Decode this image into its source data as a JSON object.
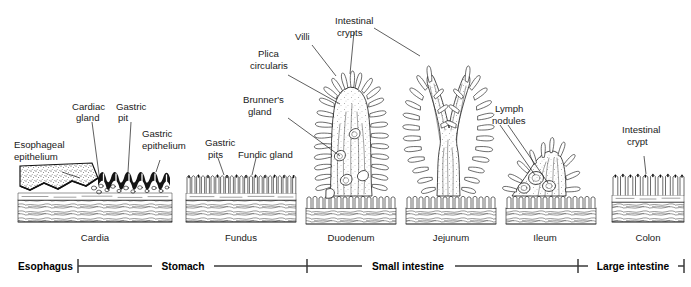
{
  "figure": {
    "background_color": "#ffffff",
    "ink_color": "#1d1d1d"
  },
  "callouts": [
    {
      "id": "esophageal-epithelium",
      "line1": "Esophageal",
      "line2": "epithelium"
    },
    {
      "id": "cardiac-gland",
      "line1": "Cardiac",
      "line2": "gland"
    },
    {
      "id": "gastric-pit",
      "line1": "Gastric",
      "line2": "pit"
    },
    {
      "id": "gastric-epithelium",
      "line1": "Gastric",
      "line2": "epithelium"
    },
    {
      "id": "gastric-pits",
      "line1": "Gastric",
      "line2": "pits"
    },
    {
      "id": "fundic-gland",
      "line1": "Fundic gland",
      "line2": ""
    },
    {
      "id": "villi",
      "line1": "Villi",
      "line2": ""
    },
    {
      "id": "intestinal-crypts",
      "line1": "Intestinal",
      "line2": "crypts"
    },
    {
      "id": "plica-circularis",
      "line1": "Plica",
      "line2": "circularis"
    },
    {
      "id": "brunners-gland",
      "line1": "Brunner's",
      "line2": "gland"
    },
    {
      "id": "lymph-nodules",
      "line1": "Lymph",
      "line2": "nodules"
    },
    {
      "id": "intestinal-crypt",
      "line1": "Intestinal",
      "line2": "crypt"
    }
  ],
  "regions": [
    {
      "id": "cardia",
      "label": "Cardia"
    },
    {
      "id": "fundus",
      "label": "Fundus"
    },
    {
      "id": "duodenum",
      "label": "Duodenum"
    },
    {
      "id": "jejunum",
      "label": "Jejunum"
    },
    {
      "id": "ileum",
      "label": "Ileum"
    },
    {
      "id": "colon",
      "label": "Colon"
    }
  ],
  "scale_bar": [
    {
      "id": "esophagus",
      "label": "Esophagus"
    },
    {
      "id": "stomach",
      "label": "Stomach"
    },
    {
      "id": "small-intestine",
      "label": "Small intestine"
    },
    {
      "id": "large-intestine",
      "label": "Large intestine"
    }
  ]
}
